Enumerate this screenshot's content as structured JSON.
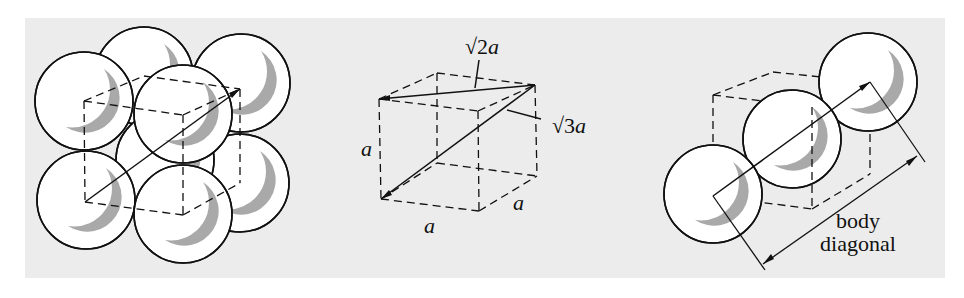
{
  "figure": {
    "panel_color": "#ececec",
    "sphere_fill": "#ffffff",
    "sphere_shadow": "#a9a9a9",
    "line_color": "#111111",
    "left": {
      "title": "body-centered cubic packing of spheres"
    },
    "middle": {
      "edge_label_left": "a",
      "edge_label_bottom": "a",
      "edge_label_right": "a",
      "face_diagonal_label": "√2a",
      "body_diagonal_label": "√3a"
    },
    "right": {
      "dimension_label_line1": "body",
      "dimension_label_line2": "diagonal"
    }
  }
}
